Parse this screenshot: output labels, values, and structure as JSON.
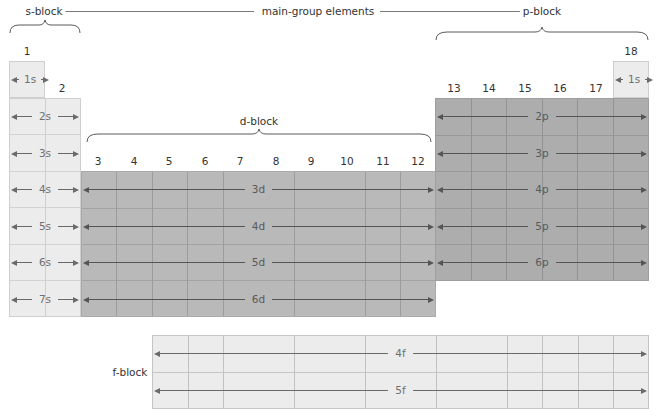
{
  "header": {
    "main_group": "main-group elements",
    "s_block": "s-block",
    "p_block": "p-block",
    "d_block": "d-block",
    "f_block": "f-block"
  },
  "groups": [
    "1",
    "2",
    "3",
    "4",
    "5",
    "6",
    "7",
    "8",
    "9",
    "10",
    "11",
    "12",
    "13",
    "14",
    "15",
    "16",
    "17",
    "18"
  ],
  "s_rows": [
    "1s",
    "2s",
    "3s",
    "4s",
    "5s",
    "6s",
    "7s"
  ],
  "s_18": "1s",
  "p_rows": [
    "2p",
    "3p",
    "4p",
    "5p",
    "6p"
  ],
  "d_rows": [
    "3d",
    "4d",
    "5d",
    "6d"
  ],
  "f_rows": [
    "4f",
    "5f"
  ],
  "colors": {
    "s_block": "#ececec",
    "d_block": "#b9b9b9",
    "p_block": "#adadad",
    "f_block": "#ececec"
  }
}
